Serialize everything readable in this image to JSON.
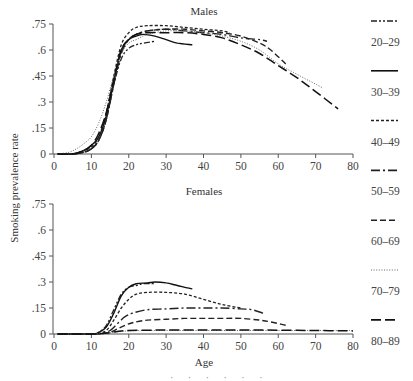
{
  "figure": {
    "y_axis_label": "Smoking prevalence rate",
    "x_axis_label": "Age",
    "footer_fragment": "·  ·  ·  ·  ·  ·"
  },
  "legend": [
    {
      "label": "20–29",
      "style": "dashdotdot"
    },
    {
      "label": "30–39",
      "style": "solid"
    },
    {
      "label": "40–49",
      "style": "shortdash"
    },
    {
      "label": "50–59",
      "style": "longdashdot"
    },
    {
      "label": "60–69",
      "style": "dash"
    },
    {
      "label": "70–79",
      "style": "dot"
    },
    {
      "label": "80–89",
      "style": "longdash"
    }
  ],
  "chart_data": [
    {
      "type": "line",
      "title": "Males",
      "xlabel": "Age",
      "ylabel": "Smoking prevalence rate",
      "xlim": [
        0,
        80
      ],
      "ylim": [
        0,
        0.75
      ],
      "x_ticks": [
        "0",
        "10",
        "20",
        "30",
        "40",
        "50",
        "60",
        "70",
        "80"
      ],
      "y_ticks": [
        "0",
        ".15",
        ".3",
        ".45",
        ".6",
        ".75"
      ],
      "grid": false,
      "legend_position": "right",
      "series": [
        {
          "name": "20–29",
          "x": [
            1,
            5,
            8,
            10,
            12,
            14,
            16,
            18,
            20,
            22,
            24,
            27
          ],
          "values": [
            0,
            0,
            0.01,
            0.03,
            0.08,
            0.2,
            0.4,
            0.55,
            0.61,
            0.63,
            0.64,
            0.65
          ]
        },
        {
          "name": "30–39",
          "x": [
            1,
            5,
            8,
            10,
            12,
            14,
            16,
            18,
            20,
            22,
            24,
            27,
            30,
            33,
            37
          ],
          "values": [
            0,
            0,
            0.02,
            0.05,
            0.1,
            0.22,
            0.42,
            0.6,
            0.66,
            0.68,
            0.69,
            0.68,
            0.66,
            0.64,
            0.63
          ]
        },
        {
          "name": "40–49",
          "x": [
            1,
            5,
            8,
            10,
            12,
            14,
            16,
            18,
            20,
            22,
            25,
            30,
            35,
            40,
            45,
            47
          ],
          "values": [
            0,
            0,
            0.02,
            0.04,
            0.1,
            0.24,
            0.45,
            0.63,
            0.7,
            0.73,
            0.74,
            0.74,
            0.73,
            0.72,
            0.71,
            0.7
          ]
        },
        {
          "name": "50–59",
          "x": [
            1,
            5,
            8,
            10,
            12,
            14,
            16,
            18,
            20,
            22,
            25,
            30,
            35,
            40,
            45,
            50,
            55,
            57
          ],
          "values": [
            0,
            0,
            0.01,
            0.03,
            0.08,
            0.2,
            0.4,
            0.58,
            0.66,
            0.69,
            0.71,
            0.72,
            0.71,
            0.7,
            0.69,
            0.67,
            0.66,
            0.65
          ]
        },
        {
          "name": "60–69",
          "x": [
            1,
            5,
            8,
            10,
            12,
            14,
            16,
            18,
            20,
            22,
            25,
            30,
            35,
            40,
            45,
            50,
            55,
            58,
            62
          ],
          "values": [
            0,
            0,
            0.01,
            0.03,
            0.08,
            0.2,
            0.42,
            0.6,
            0.66,
            0.69,
            0.71,
            0.72,
            0.72,
            0.71,
            0.7,
            0.68,
            0.64,
            0.6,
            0.52
          ]
        },
        {
          "name": "70–79",
          "x": [
            1,
            4,
            6,
            8,
            10,
            12,
            14,
            16,
            18,
            20,
            22,
            25,
            30,
            35,
            40,
            45,
            50,
            55,
            60,
            65,
            72
          ],
          "values": [
            0,
            0.01,
            0.03,
            0.06,
            0.1,
            0.18,
            0.3,
            0.45,
            0.58,
            0.64,
            0.66,
            0.69,
            0.71,
            0.71,
            0.7,
            0.68,
            0.65,
            0.6,
            0.52,
            0.46,
            0.38
          ]
        },
        {
          "name": "80–89",
          "x": [
            1,
            5,
            8,
            10,
            12,
            14,
            16,
            18,
            20,
            22,
            25,
            30,
            35,
            40,
            45,
            50,
            55,
            60,
            65,
            70,
            76
          ],
          "values": [
            0,
            0,
            0.02,
            0.05,
            0.12,
            0.24,
            0.43,
            0.6,
            0.66,
            0.69,
            0.7,
            0.7,
            0.7,
            0.69,
            0.67,
            0.63,
            0.58,
            0.51,
            0.44,
            0.36,
            0.26
          ]
        }
      ]
    },
    {
      "type": "line",
      "title": "Females",
      "xlabel": "Age",
      "ylabel": "Smoking prevalence rate",
      "xlim": [
        0,
        80
      ],
      "ylim": [
        0,
        0.75
      ],
      "x_ticks": [
        "0",
        "10",
        "20",
        "30",
        "40",
        "50",
        "60",
        "70",
        "80"
      ],
      "y_ticks": [
        "0",
        ".15",
        ".3",
        ".45",
        ".6",
        ".75"
      ],
      "grid": false,
      "legend_position": "right",
      "series": [
        {
          "name": "20–29",
          "x": [
            1,
            10,
            12,
            14,
            16,
            18,
            20,
            22,
            24,
            27
          ],
          "values": [
            0,
            0,
            0.01,
            0.05,
            0.14,
            0.23,
            0.27,
            0.28,
            0.29,
            0.29
          ]
        },
        {
          "name": "30–39",
          "x": [
            1,
            10,
            12,
            14,
            16,
            18,
            20,
            22,
            25,
            27,
            30,
            33,
            37
          ],
          "values": [
            0,
            0,
            0.01,
            0.04,
            0.12,
            0.22,
            0.27,
            0.29,
            0.295,
            0.3,
            0.295,
            0.28,
            0.26
          ]
        },
        {
          "name": "40–49",
          "x": [
            1,
            10,
            12,
            14,
            16,
            18,
            20,
            22,
            25,
            30,
            35,
            40,
            45,
            50
          ],
          "values": [
            0,
            0,
            0.005,
            0.02,
            0.08,
            0.15,
            0.2,
            0.23,
            0.24,
            0.24,
            0.23,
            0.2,
            0.17,
            0.15
          ]
        },
        {
          "name": "50–59",
          "x": [
            1,
            10,
            13,
            15,
            17,
            19,
            21,
            25,
            30,
            35,
            40,
            45,
            50,
            53,
            56
          ],
          "values": [
            0,
            0,
            0.005,
            0.02,
            0.06,
            0.1,
            0.12,
            0.14,
            0.145,
            0.15,
            0.15,
            0.15,
            0.145,
            0.14,
            0.12
          ]
        },
        {
          "name": "60–69",
          "x": [
            1,
            10,
            13,
            15,
            17,
            19,
            21,
            25,
            30,
            35,
            40,
            45,
            50,
            55,
            58,
            62
          ],
          "values": [
            0,
            0,
            0.003,
            0.01,
            0.03,
            0.05,
            0.065,
            0.08,
            0.085,
            0.09,
            0.09,
            0.09,
            0.09,
            0.08,
            0.07,
            0.05
          ]
        },
        {
          "name": "70–79",
          "x": [
            1,
            10,
            14,
            17,
            20,
            25,
            30,
            40,
            50,
            60,
            70,
            80
          ],
          "values": [
            0,
            0,
            0.005,
            0.012,
            0.018,
            0.02,
            0.02,
            0.02,
            0.02,
            0.02,
            0.02,
            0.02
          ]
        },
        {
          "name": "80–89",
          "x": [
            1,
            10,
            14,
            17,
            20,
            25,
            30,
            40,
            50,
            60,
            70,
            80
          ],
          "values": [
            0,
            0,
            0.005,
            0.015,
            0.02,
            0.022,
            0.023,
            0.023,
            0.023,
            0.022,
            0.02,
            0.018
          ]
        }
      ]
    }
  ]
}
